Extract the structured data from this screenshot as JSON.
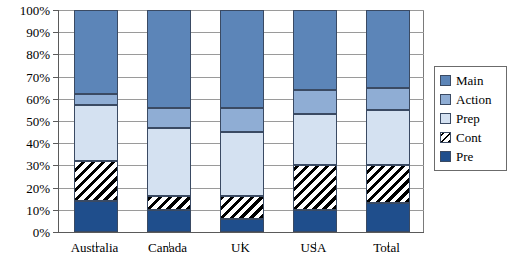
{
  "chart_data": {
    "type": "bar",
    "subtype": "stacked-bar-100-percent",
    "title": "",
    "subtitle": "",
    "xlabel": "",
    "ylabel": "",
    "categories": [
      "Australia",
      "Canada",
      "UK",
      "USA",
      "Total"
    ],
    "ylim": [
      0,
      100
    ],
    "yticks": [
      0,
      10,
      20,
      30,
      40,
      50,
      60,
      70,
      80,
      90,
      100
    ],
    "ytick_labels": [
      "0%",
      "10%",
      "20%",
      "30%",
      "40%",
      "50%",
      "60%",
      "70%",
      "80%",
      "90%",
      "100%"
    ],
    "grid": true,
    "grid_axis": "y",
    "legend_position": "right",
    "stack_order_bottom_to_top": [
      "Pre",
      "Cont",
      "Prep",
      "Action",
      "Main"
    ],
    "series": [
      {
        "name": "Main",
        "color": "#5c85b8",
        "values": [
          38,
          44,
          44,
          36,
          35
        ]
      },
      {
        "name": "Action",
        "color": "#8fadd4",
        "values": [
          5,
          9,
          11,
          11,
          10
        ]
      },
      {
        "name": "Prep",
        "color": "#d4e1f1",
        "values": [
          25,
          31,
          29,
          23,
          25
        ]
      },
      {
        "name": "Cont",
        "color": "#000000",
        "pattern": "diagonal-hatch",
        "values": [
          18,
          6,
          10,
          20,
          17
        ]
      },
      {
        "name": "Pre",
        "color": "#1f4e8c",
        "values": [
          14,
          10,
          6,
          10,
          13
        ]
      }
    ],
    "cumulative_tops": {
      "Australia": {
        "Pre": 14,
        "Cont": 32,
        "Prep": 57,
        "Action": 62,
        "Main": 100
      },
      "Canada": {
        "Pre": 10,
        "Cont": 16,
        "Prep": 47,
        "Action": 56,
        "Main": 100
      },
      "UK": {
        "Pre": 6,
        "Cont": 16,
        "Prep": 45,
        "Action": 56,
        "Main": 100
      },
      "USA": {
        "Pre": 10,
        "Cont": 30,
        "Prep": 53,
        "Action": 64,
        "Main": 100
      },
      "Total": {
        "Pre": 13,
        "Cont": 30,
        "Prep": 55,
        "Action": 65,
        "Main": 100
      }
    }
  },
  "legend": {
    "items": [
      {
        "label": "Main",
        "swatch": "sw-main"
      },
      {
        "label": "Action",
        "swatch": "sw-action"
      },
      {
        "label": "Prep",
        "swatch": "sw-prep"
      },
      {
        "label": "Cont",
        "swatch": "sw-cont"
      },
      {
        "label": "Pre",
        "swatch": "sw-pre"
      }
    ]
  }
}
